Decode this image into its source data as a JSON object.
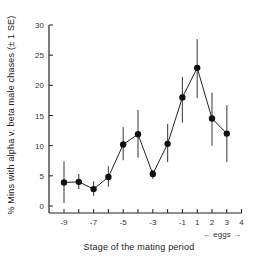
{
  "chart_data": {
    "type": "line",
    "title": "",
    "xlabel": "Stage of the mating period",
    "ylabel": "% Mins with alpha v. beta male chases (± 1 SE)",
    "x_tick_labels": [
      "-9",
      "-7",
      "-5",
      "-3",
      "-1",
      "1",
      "2",
      "3",
      "4"
    ],
    "y_tick_labels": [
      "0",
      "5",
      "10",
      "15",
      "20",
      "25",
      "30"
    ],
    "ylim": [
      0,
      30
    ],
    "grid": false,
    "annotation": "← eggs →",
    "x": [
      "-9",
      "-8",
      "-7",
      "-6",
      "-5",
      "-4",
      "-3",
      "-2",
      "-1",
      "1",
      "2",
      "3"
    ],
    "series": [
      {
        "name": "alpha v. beta male chases",
        "values": [
          3.9,
          4.0,
          2.8,
          4.8,
          10.2,
          11.9,
          5.3,
          10.3,
          18.0,
          22.9,
          14.5,
          12.0
        ],
        "error_low": [
          0.5,
          2.8,
          1.7,
          3.2,
          7.6,
          8.0,
          4.5,
          7.3,
          13.8,
          17.9,
          10.0,
          7.3
        ],
        "error_high": [
          7.4,
          5.3,
          4.1,
          6.6,
          13.1,
          15.9,
          6.0,
          13.6,
          21.4,
          27.7,
          18.8,
          16.7
        ]
      }
    ]
  }
}
